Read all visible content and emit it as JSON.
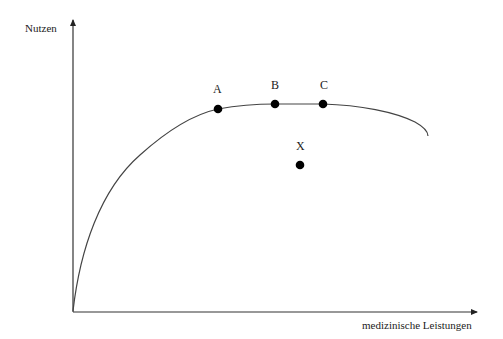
{
  "axes": {
    "y_label": "Nutzen",
    "x_label": "medizinische Leistungen"
  },
  "curve": {
    "description": "concave utility curve rising steeply from origin, flattening, then bending downward",
    "path": "M73,311 C80,250 100,190 140,155 C170,128 195,114 218,109 C240,105 258,104 275,104 C295,104 310,104 323,104 C360,105 395,112 415,122 C424,127 428,131 428,136"
  },
  "points": [
    {
      "label": "A",
      "x": 218,
      "y": 109,
      "on_curve": true
    },
    {
      "label": "B",
      "x": 275,
      "y": 104,
      "on_curve": true
    },
    {
      "label": "C",
      "x": 323,
      "y": 104,
      "on_curve": true
    },
    {
      "label": "X",
      "x": 300,
      "y": 165,
      "on_curve": false
    }
  ],
  "colors": {
    "axis": "#333333",
    "curve": "#444444",
    "point": "#000000",
    "text": "#222222",
    "background": "#ffffff"
  }
}
